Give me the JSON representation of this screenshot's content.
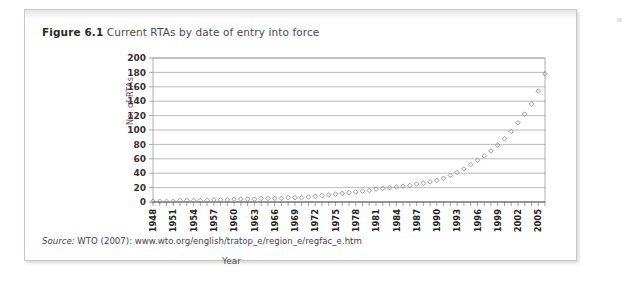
{
  "figure": {
    "label": "Figure 6.1",
    "caption": "Current RTAs by date of entry into force",
    "source_word": "Source:",
    "source_text": " WTO (2007): www.wto.org/english/tratop_e/region_e/regfac_e.htm"
  },
  "colors": {
    "card_border": "#c8c8c8",
    "grid": "#8d8d8d",
    "marker_stroke": "#8a8a8a",
    "text": "#333333",
    "caption": "#3a3a3a"
  },
  "chart_data": {
    "type": "scatter",
    "title": "Current RTAs by date of entry into force",
    "xlabel": "Year",
    "ylabel": "No. of RTAs",
    "xlim": [
      1948,
      2006
    ],
    "ylim": [
      0,
      200
    ],
    "ytick_step": 20,
    "yticks": [
      0,
      20,
      40,
      60,
      80,
      100,
      120,
      140,
      160,
      180,
      200
    ],
    "xtick_labels": [
      1948,
      1951,
      1954,
      1957,
      1960,
      1963,
      1966,
      1969,
      1972,
      1975,
      1978,
      1981,
      1984,
      1987,
      1990,
      1993,
      1996,
      1999,
      2002,
      2005
    ],
    "xtick_label_interval": 3,
    "grid": "horizontal",
    "legend": "none",
    "marker": "open-diamond",
    "x": [
      1948,
      1949,
      1950,
      1951,
      1952,
      1953,
      1954,
      1955,
      1956,
      1957,
      1958,
      1959,
      1960,
      1961,
      1962,
      1963,
      1964,
      1965,
      1966,
      1967,
      1968,
      1969,
      1970,
      1971,
      1972,
      1973,
      1974,
      1975,
      1976,
      1977,
      1978,
      1979,
      1980,
      1981,
      1982,
      1983,
      1984,
      1985,
      1986,
      1987,
      1988,
      1989,
      1990,
      1991,
      1992,
      1993,
      1994,
      1995,
      1996,
      1997,
      1998,
      1999,
      2000,
      2001,
      2002,
      2003,
      2004,
      2005,
      2006
    ],
    "values": [
      1,
      1,
      1,
      1,
      2,
      2,
      2,
      2,
      2,
      3,
      3,
      3,
      4,
      4,
      4,
      4,
      5,
      5,
      5,
      5,
      6,
      6,
      6,
      7,
      8,
      9,
      10,
      11,
      12,
      13,
      14,
      15,
      16,
      18,
      19,
      20,
      21,
      22,
      23,
      25,
      26,
      28,
      30,
      33,
      37,
      41,
      46,
      52,
      58,
      64,
      71,
      79,
      88,
      98,
      110,
      122,
      136,
      154,
      178
    ],
    "series": [
      {
        "name": "Current RTAs",
        "values": [
          1,
          1,
          1,
          1,
          2,
          2,
          2,
          2,
          2,
          3,
          3,
          3,
          4,
          4,
          4,
          4,
          5,
          5,
          5,
          5,
          6,
          6,
          6,
          7,
          8,
          9,
          10,
          11,
          12,
          13,
          14,
          15,
          16,
          18,
          19,
          20,
          21,
          22,
          23,
          25,
          26,
          28,
          30,
          33,
          37,
          41,
          46,
          52,
          58,
          64,
          71,
          79,
          88,
          98,
          110,
          122,
          136,
          154,
          178
        ]
      }
    ]
  }
}
